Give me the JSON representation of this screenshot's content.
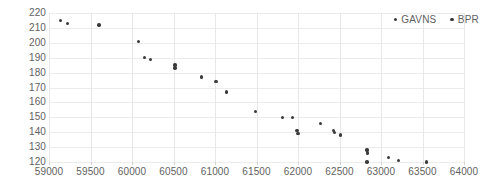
{
  "chart_data": {
    "type": "scatter",
    "title": "",
    "xlabel": "",
    "ylabel": "",
    "xlim": [
      59000,
      64000
    ],
    "ylim": [
      120,
      220
    ],
    "xticks": [
      59000,
      59500,
      60000,
      60500,
      61000,
      61500,
      62000,
      62500,
      63000,
      63500,
      64000
    ],
    "yticks": [
      120,
      130,
      140,
      150,
      160,
      170,
      180,
      190,
      200,
      210,
      220
    ],
    "grid": true,
    "legend_position": "top-right",
    "marker_color": "#3a3a3a",
    "series": [
      {
        "name": "GAVNS",
        "color": "#3a3a3a",
        "points": [
          [
            59140,
            215
          ],
          [
            59220,
            213
          ],
          [
            59600,
            212
          ],
          [
            60080,
            201
          ],
          [
            60150,
            190
          ],
          [
            60220,
            189
          ],
          [
            60520,
            185
          ],
          [
            60520,
            183
          ],
          [
            60840,
            177
          ],
          [
            61010,
            174
          ],
          [
            61140,
            167
          ],
          [
            61490,
            154
          ],
          [
            61810,
            150
          ],
          [
            61930,
            150
          ],
          [
            61990,
            141
          ],
          [
            62000,
            139
          ],
          [
            62270,
            146
          ],
          [
            62430,
            141
          ],
          [
            62440,
            140
          ],
          [
            62510,
            138
          ],
          [
            62830,
            128
          ],
          [
            62840,
            126
          ],
          [
            62830,
            120
          ],
          [
            63090,
            123
          ],
          [
            63210,
            121
          ],
          [
            63550,
            120
          ]
        ]
      },
      {
        "name": "BPR",
        "color": "#3a3a3a",
        "points": []
      }
    ]
  },
  "legend": {
    "items": [
      {
        "label": "GAVNS",
        "color": "#3a3a3a"
      },
      {
        "label": "BPR",
        "color": "#3a3a3a"
      }
    ]
  }
}
